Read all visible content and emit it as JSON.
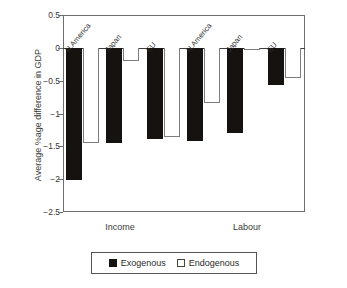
{
  "chart_data": {
    "type": "bar",
    "title": "",
    "xlabel": "",
    "ylabel": "Average %age difference in GDP",
    "ylim": [
      -2.5,
      0.5
    ],
    "yticks": [
      "0.5",
      "0",
      "-0.5",
      "-1",
      "-1.5",
      "-2",
      "-2.5"
    ],
    "ytick_values": [
      0.5,
      0,
      -0.5,
      -1,
      -1.5,
      -2,
      -2.5
    ],
    "grid": false,
    "legend_position": "bottom",
    "groups": [
      "Income",
      "Labour"
    ],
    "categories": [
      "N.America",
      "Japan",
      "EU",
      "N.America",
      "Japan",
      "EU"
    ],
    "series": [
      {
        "name": "Exogenous",
        "values": [
          -2.01,
          -1.45,
          -1.39,
          -1.42,
          -1.29,
          -0.56
        ]
      },
      {
        "name": "Endogenous",
        "values": [
          -1.45,
          -0.2,
          -1.36,
          -0.84,
          -0.04,
          -0.46
        ]
      }
    ],
    "legend": [
      "Exogenous",
      "Endogenous"
    ],
    "colors": {
      "exogenous": "#16120f",
      "endogenous": "#ffffff",
      "axis": "#3c3c3c",
      "frame": "#6e6e6e"
    }
  },
  "axis": {
    "y_title": "Average %age difference in GDP"
  },
  "group_labels": [
    {
      "text": "Income"
    },
    {
      "text": "Labour"
    }
  ],
  "legend": {
    "items": [
      {
        "label": "Exogenous"
      },
      {
        "label": "Endogenous"
      }
    ]
  }
}
